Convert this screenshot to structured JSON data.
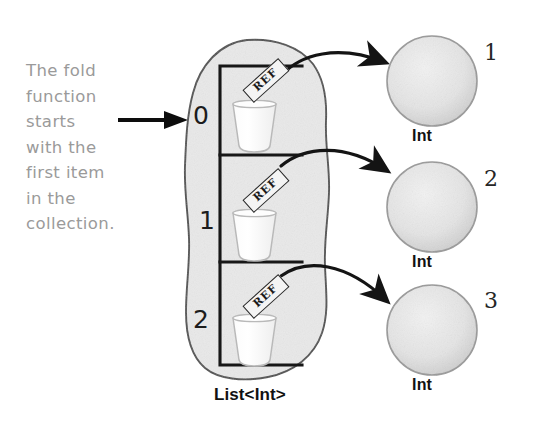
{
  "annotation": {
    "text": "The fold\nfunction\nstarts\nwith the\nfirst item\nin the\ncollection.",
    "color": "#9a9a9a"
  },
  "pointer": {
    "icon": "right-arrow-icon",
    "target": "0"
  },
  "collection": {
    "caption": "List<Int>",
    "fill_color": "#e9e9e9",
    "outline_color": "#555555",
    "cells": [
      {
        "index": "0",
        "ref_label": "REF",
        "vessel": "cup-icon"
      },
      {
        "index": "1",
        "ref_label": "REF",
        "vessel": "cup-icon"
      },
      {
        "index": "2",
        "ref_label": "REF",
        "vessel": "cup-icon"
      }
    ]
  },
  "objects": [
    {
      "value": "1",
      "type": "Int",
      "fill_color": "#e3e3e3"
    },
    {
      "value": "2",
      "type": "Int",
      "fill_color": "#e3e3e3"
    },
    {
      "value": "3",
      "type": "Int",
      "fill_color": "#e3e3e3"
    }
  ],
  "references": [
    {
      "from": "0",
      "to": "1"
    },
    {
      "from": "1",
      "to": "2"
    },
    {
      "from": "2",
      "to": "3"
    }
  ]
}
